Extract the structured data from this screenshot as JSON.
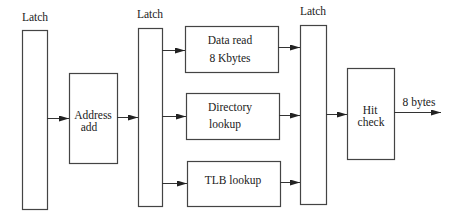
{
  "diagram": {
    "type": "pipeline-block-diagram",
    "latches": [
      {
        "id": "latch1",
        "label": "Latch"
      },
      {
        "id": "latch2",
        "label": "Latch"
      },
      {
        "id": "latch3",
        "label": "Latch"
      }
    ],
    "blocks": [
      {
        "id": "address-add",
        "lines": [
          "Address",
          "add"
        ]
      },
      {
        "id": "data-read",
        "lines": [
          "Data read",
          "8 Kbytes"
        ]
      },
      {
        "id": "directory-lookup",
        "lines": [
          "Directory",
          "lookup"
        ]
      },
      {
        "id": "tlb-lookup",
        "lines": [
          "TLB lookup"
        ]
      },
      {
        "id": "hit-check",
        "lines": [
          "Hit",
          "check"
        ]
      }
    ],
    "output": {
      "label": "8 bytes"
    },
    "edges": [
      {
        "from": "latch1",
        "to": "address-add"
      },
      {
        "from": "address-add",
        "to": "latch2"
      },
      {
        "from": "latch2",
        "to": "data-read"
      },
      {
        "from": "latch2",
        "to": "directory-lookup"
      },
      {
        "from": "latch2",
        "to": "tlb-lookup"
      },
      {
        "from": "data-read",
        "to": "latch3"
      },
      {
        "from": "directory-lookup",
        "to": "latch3"
      },
      {
        "from": "tlb-lookup",
        "to": "latch3"
      },
      {
        "from": "latch3",
        "to": "hit-check"
      },
      {
        "from": "hit-check",
        "to": "output"
      }
    ]
  }
}
